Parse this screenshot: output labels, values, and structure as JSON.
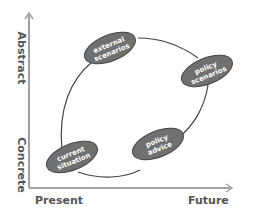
{
  "diagram": {
    "axes": {
      "y_top_label": "Abstract",
      "y_bottom_label": "Concrete",
      "x_left_label": "Present",
      "x_right_label": "Future",
      "axis_color": "#999999",
      "label_color": "#555555"
    },
    "cycle": {
      "stroke_color": "#444444"
    },
    "nodes": [
      {
        "id": "external-scenarios",
        "line1": "external",
        "line2": "scenarios"
      },
      {
        "id": "policy-scenarios",
        "line1": "policy",
        "line2": "scenarios"
      },
      {
        "id": "policy-advice",
        "line1": "policy",
        "line2": "advice"
      },
      {
        "id": "current-situation",
        "line1": "current",
        "line2": "situation"
      }
    ],
    "node_fill": "#707070",
    "node_stroke": "#444444",
    "node_text_color": "#ffffff"
  }
}
